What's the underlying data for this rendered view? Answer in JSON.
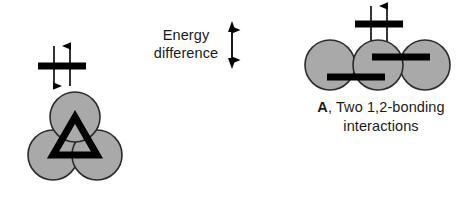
{
  "figure": {
    "background_color": "#ffffff",
    "orbital_fill_color": "#a9a9a9",
    "orbital_stroke_color": "#2b2b2b",
    "bar_color": "#000000",
    "text_color": "#1a1a1a"
  },
  "left_structure": {
    "name": "cyclic-triangular-three-orbital-arrangement",
    "orbital_count": 3,
    "arrangement": "triangular",
    "orbitals": [
      {
        "label": "orbital-top",
        "cx": 75,
        "cy": 117,
        "r": 25
      },
      {
        "label": "orbital-bottom-left",
        "cx": 53,
        "cy": 155,
        "r": 25
      },
      {
        "label": "orbital-bottom-right",
        "cx": 97,
        "cy": 155,
        "r": 25
      }
    ],
    "bond_triangle": {
      "label": "three-center-bond-triangle",
      "points": "75,117 53,155 97,155"
    },
    "energy_level": {
      "label": "energy-level-bar",
      "x1": 38,
      "x2": 86,
      "y": 66,
      "electrons": [
        {
          "spin": "down",
          "x": 54
        },
        {
          "spin": "up",
          "x": 70
        }
      ]
    }
  },
  "center_annotation": {
    "line1": "Energy",
    "line2": "difference",
    "arrow": {
      "label": "double-headed-vertical-arrow",
      "x": 232,
      "y_top": 22,
      "y_bottom": 68
    }
  },
  "right_structure": {
    "name": "linear-three-orbital-arrangement",
    "orbital_count": 3,
    "arrangement": "linear",
    "orbitals": [
      {
        "label": "orbital-left",
        "cx": 330,
        "cy": 65,
        "r": 25
      },
      {
        "label": "orbital-center",
        "cx": 378,
        "cy": 65,
        "r": 25
      },
      {
        "label": "orbital-right",
        "cx": 425,
        "cy": 65,
        "r": 25
      }
    ],
    "bonds": [
      {
        "label": "bond-1-2-lower",
        "x1": 327,
        "x2": 385,
        "y": 77
      },
      {
        "label": "bond-2-3-upper",
        "x1": 372,
        "x2": 430,
        "y": 57
      }
    ],
    "energy_level": {
      "label": "energy-level-bar",
      "x1": 355,
      "x2": 403,
      "y": 24,
      "electrons": [
        {
          "spin": "down",
          "x": 371
        },
        {
          "spin": "up",
          "x": 387
        }
      ]
    },
    "caption": {
      "lead": "A",
      "rest": ", Two 1,2-bonding",
      "line2": "interactions"
    }
  }
}
